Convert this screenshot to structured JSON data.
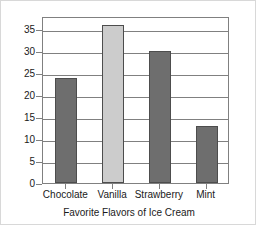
{
  "chart_data": {
    "type": "bar",
    "title": "Favorite Flavors of Ice Cream",
    "title_position": "bottom",
    "xlabel": "",
    "ylabel": "",
    "categories": [
      "Chocolate",
      "Vanilla",
      "Strawberry",
      "Mint"
    ],
    "values": [
      24,
      36,
      30,
      13
    ],
    "series": [
      {
        "name": "Votes",
        "values": [
          24,
          36,
          30,
          13
        ]
      }
    ],
    "ylim": [
      0,
      38
    ],
    "yticks": [
      0,
      5,
      10,
      15,
      20,
      25,
      30,
      35
    ],
    "ytick_labels": [
      "0",
      "5",
      "10",
      "15",
      "20",
      "25",
      "30",
      "35"
    ],
    "grid": true,
    "grid_axis": "y",
    "legend": false,
    "bar_colors": [
      "#6e6e6e",
      "#cccccc",
      "#6e6e6e",
      "#6e6e6e"
    ],
    "bar_edge_color": "#4d4d4d",
    "axis_color": "#808080",
    "background_color": "#ffffff",
    "text_color": "#1a1a1a"
  }
}
